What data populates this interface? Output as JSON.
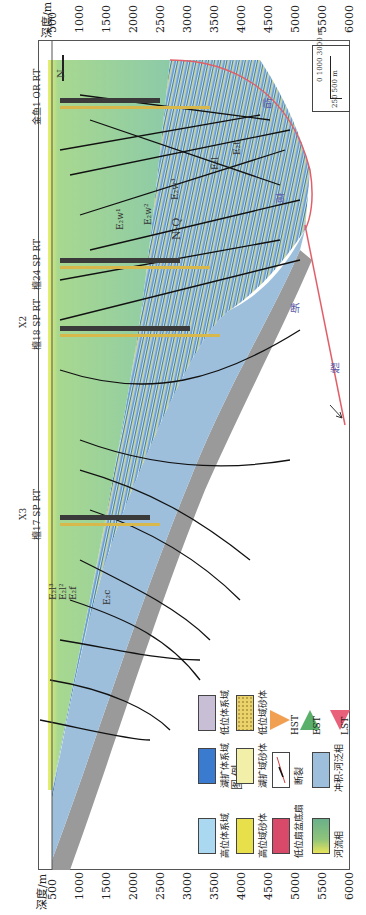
{
  "axis": {
    "unit_label": "深度/m",
    "ticks": [
      "500",
      "1000",
      "1500",
      "2000",
      "2500",
      "3000",
      "3500",
      "4000",
      "4500",
      "5000",
      "5500",
      "6000"
    ]
  },
  "wells": [
    {
      "name": "金鱼1",
      "tags": "OR RT"
    },
    {
      "name": "檀24",
      "tags": "SP RT"
    },
    {
      "name": "檀18",
      "tags": "SP RT",
      "marker": "X2"
    },
    {
      "name": "檀17",
      "tags": "SP RT",
      "marker": "X3"
    }
  ],
  "north_label": "N",
  "scale_bar": {
    "horizontal": [
      "0",
      "1000",
      "3000 m"
    ],
    "vertical": [
      "0",
      "250",
      "500",
      "m"
    ]
  },
  "formation_labels": {
    "nq": "N-Q",
    "e2w1": "E₂w¹",
    "e2w2": "E₂w²",
    "e2w3": "E₂w³",
    "e2l": "E₂l",
    "e2t": "E₂t",
    "e2c": "E₂c",
    "e2f": "E₂f",
    "e2l2": "E₂l²",
    "e2l3": "E₂l³"
  },
  "fault_name_chars": [
    "临",
    "高",
    "断",
    "裂"
  ],
  "legend": {
    "title": "图 例",
    "items": [
      {
        "label": "高位体系域",
        "color": "#a9d8f0"
      },
      {
        "label": "湖扩体系域",
        "color": "#3a7bd0"
      },
      {
        "label": "低位体系域",
        "color": "#c8bfd6"
      },
      {
        "label": "高位域砂体",
        "color": "#e8e04a"
      },
      {
        "label": "湖扩域砂体",
        "color": "#f2f0a8"
      },
      {
        "label": "低位域砂体",
        "color": "#e9d36a"
      },
      {
        "label": "低位扇盆底扇",
        "color": "#d94a6a"
      },
      {
        "label": "断裂",
        "color": "#ffffff"
      },
      {
        "label": "冲积-河泛相",
        "color": "#9dbfdc"
      },
      {
        "label": "河流相",
        "color": "#8fc47a"
      }
    ],
    "systems_tracts": [
      {
        "label": "HST",
        "colors": [
          "#f4c94a",
          "#f08a5a"
        ]
      },
      {
        "label": "EST",
        "colors": [
          "#7cc47a",
          "#3a9a5a"
        ]
      },
      {
        "label": "LST",
        "colors": [
          "#e8607a",
          "#f2a0a0"
        ]
      }
    ]
  }
}
